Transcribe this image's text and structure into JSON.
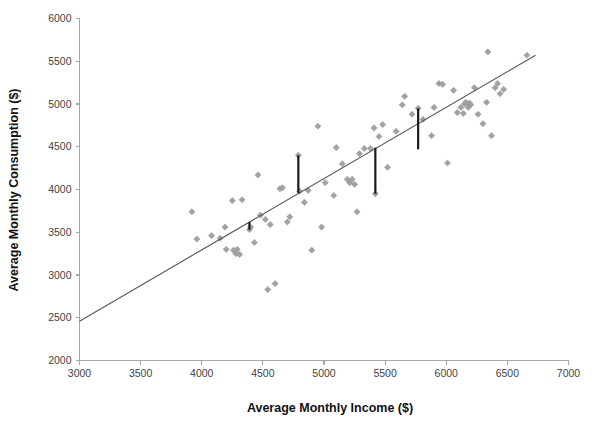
{
  "chart_data": {
    "type": "scatter",
    "title": "",
    "xlabel": "Average Monthly Income ($)",
    "ylabel": "Average Monthly Consumption ($)",
    "xlim": [
      3000,
      7000
    ],
    "ylim": [
      2000,
      6000
    ],
    "xticks": [
      3000,
      3500,
      4000,
      4500,
      5000,
      5500,
      6000,
      6500,
      7000
    ],
    "yticks": [
      2000,
      2500,
      3000,
      3500,
      4000,
      4500,
      5000,
      5500,
      6000
    ],
    "xtick_labels": [
      "3000",
      "3500",
      "4000",
      "4500",
      "5000",
      "5500",
      "6000",
      "6500",
      "7000"
    ],
    "ytick_labels": [
      "2000",
      "2500",
      "3000",
      "3500",
      "4000",
      "4500",
      "5000",
      "5500",
      "6000"
    ],
    "grid": false,
    "legend": "none",
    "point_color": "#a2a2a2",
    "line_color": "#595959",
    "residual_color": "#1a1a1a",
    "series": [
      {
        "name": "observations",
        "points": [
          [
            3920,
            3740
          ],
          [
            3960,
            3420
          ],
          [
            4080,
            3460
          ],
          [
            4150,
            3430
          ],
          [
            4190,
            3560
          ],
          [
            4200,
            3300
          ],
          [
            4250,
            3870
          ],
          [
            4260,
            3290
          ],
          [
            4280,
            3250
          ],
          [
            4290,
            3300
          ],
          [
            4310,
            3240
          ],
          [
            4330,
            3880
          ],
          [
            4390,
            3530
          ],
          [
            4400,
            3560
          ],
          [
            4430,
            3380
          ],
          [
            4460,
            4170
          ],
          [
            4480,
            3700
          ],
          [
            4520,
            3650
          ],
          [
            4540,
            2830
          ],
          [
            4560,
            3590
          ],
          [
            4600,
            2900
          ],
          [
            4640,
            4010
          ],
          [
            4660,
            4020
          ],
          [
            4700,
            3620
          ],
          [
            4720,
            3680
          ],
          [
            4790,
            4400
          ],
          [
            4800,
            3980
          ],
          [
            4840,
            3850
          ],
          [
            4870,
            3990
          ],
          [
            4900,
            3290
          ],
          [
            4950,
            4740
          ],
          [
            4980,
            3560
          ],
          [
            5010,
            4080
          ],
          [
            5080,
            3930
          ],
          [
            5100,
            4490
          ],
          [
            5150,
            4300
          ],
          [
            5190,
            4120
          ],
          [
            5210,
            4080
          ],
          [
            5230,
            4120
          ],
          [
            5250,
            4060
          ],
          [
            5270,
            3740
          ],
          [
            5290,
            4420
          ],
          [
            5330,
            4480
          ],
          [
            5380,
            4480
          ],
          [
            5410,
            4720
          ],
          [
            5420,
            3950
          ],
          [
            5450,
            4620
          ],
          [
            5480,
            4760
          ],
          [
            5520,
            4260
          ],
          [
            5590,
            4680
          ],
          [
            5640,
            4990
          ],
          [
            5660,
            5090
          ],
          [
            5720,
            4880
          ],
          [
            5770,
            4950
          ],
          [
            5810,
            4820
          ],
          [
            5880,
            4630
          ],
          [
            5900,
            4960
          ],
          [
            5940,
            5240
          ],
          [
            5970,
            5230
          ],
          [
            6010,
            4310
          ],
          [
            6060,
            5160
          ],
          [
            6090,
            4900
          ],
          [
            6120,
            4960
          ],
          [
            6140,
            4890
          ],
          [
            6150,
            5000
          ],
          [
            6160,
            5020
          ],
          [
            6180,
            4960
          ],
          [
            6190,
            5010
          ],
          [
            6200,
            4990
          ],
          [
            6230,
            5190
          ],
          [
            6260,
            4880
          ],
          [
            6300,
            4770
          ],
          [
            6330,
            5020
          ],
          [
            6340,
            5610
          ],
          [
            6370,
            4630
          ],
          [
            6400,
            5190
          ],
          [
            6420,
            5240
          ],
          [
            6440,
            5120
          ],
          [
            6470,
            5170
          ],
          [
            6660,
            5570
          ]
        ]
      }
    ],
    "fit_line": {
      "name": "regression-line",
      "x_start": 3000,
      "y_start": 2460,
      "x_end": 6730,
      "y_end": 5570
    },
    "residuals": [
      {
        "x": 4390,
        "y_point": 3530,
        "y_fit": 3620
      },
      {
        "x": 4790,
        "y_point": 4400,
        "y_fit": 3960
      },
      {
        "x": 5420,
        "y_point": 3950,
        "y_fit": 4490
      },
      {
        "x": 5770,
        "y_point": 4950,
        "y_fit": 4470
      }
    ]
  }
}
